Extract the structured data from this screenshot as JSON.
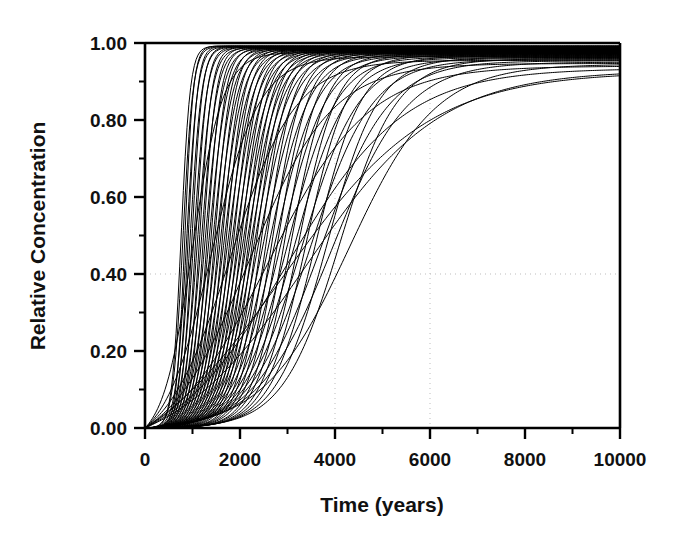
{
  "chart_data": {
    "type": "line",
    "title": "",
    "subtitle": "",
    "xlabel": "Time (years)",
    "ylabel": "Relative Concentration",
    "xlim": [
      0,
      10000
    ],
    "ylim": [
      0.0,
      1.0
    ],
    "x_major_ticks": [
      0,
      2000,
      4000,
      6000,
      8000,
      10000
    ],
    "x_major_tick_labels": [
      "0",
      "2000",
      "4000",
      "6000",
      "8000",
      "10000"
    ],
    "x_minor_ticks": [
      1000,
      3000,
      5000,
      7000,
      9000
    ],
    "y_major_ticks": [
      0.0,
      0.2,
      0.4,
      0.6,
      0.8,
      1.0
    ],
    "y_major_tick_labels": [
      "0.00",
      "0.20",
      "0.40",
      "0.60",
      "0.80",
      "1.00"
    ],
    "y_minor_ticks": [
      0.1,
      0.3,
      0.5,
      0.7,
      0.9
    ],
    "grid": {
      "visible": true,
      "style": "dotted",
      "color": "#bdbdbd",
      "x_gridlines": [
        4000,
        6000
      ],
      "y_gridlines": [
        0.4
      ]
    },
    "legend": {
      "visible": false,
      "position": "none"
    },
    "line_color": "#000000",
    "line_width": 1.0,
    "series_count": 72,
    "series": [
      {
        "name": "realization-1",
        "t50": 760,
        "spread": 210,
        "tail": 0.0
      },
      {
        "name": "realization-2",
        "t50": 800,
        "spread": 230,
        "tail": 0.0
      },
      {
        "name": "realization-3",
        "t50": 840,
        "spread": 195,
        "tail": 0.0
      },
      {
        "name": "realization-4",
        "t50": 880,
        "spread": 250,
        "tail": 0.0
      },
      {
        "name": "realization-5",
        "t50": 910,
        "spread": 215,
        "tail": 0.0
      },
      {
        "name": "realization-6",
        "t50": 950,
        "spread": 270,
        "tail": 0.0
      },
      {
        "name": "realization-7",
        "t50": 990,
        "spread": 240,
        "tail": 0.0
      },
      {
        "name": "realization-8",
        "t50": 1030,
        "spread": 300,
        "tail": 0.0
      },
      {
        "name": "realization-9",
        "t50": 1070,
        "spread": 260,
        "tail": 0.0
      },
      {
        "name": "realization-10",
        "t50": 1110,
        "spread": 330,
        "tail": 0.0
      },
      {
        "name": "realization-11",
        "t50": 1150,
        "spread": 280,
        "tail": 0.0
      },
      {
        "name": "realization-12",
        "t50": 1190,
        "spread": 360,
        "tail": 0.0
      },
      {
        "name": "realization-13",
        "t50": 1230,
        "spread": 300,
        "tail": 0.0
      },
      {
        "name": "realization-14",
        "t50": 1270,
        "spread": 390,
        "tail": 0.0
      },
      {
        "name": "realization-15",
        "t50": 1310,
        "spread": 320,
        "tail": 0.0
      },
      {
        "name": "realization-16",
        "t50": 1350,
        "spread": 420,
        "tail": 0.0
      },
      {
        "name": "realization-17",
        "t50": 1390,
        "spread": 340,
        "tail": 0.0
      },
      {
        "name": "realization-18",
        "t50": 1430,
        "spread": 450,
        "tail": 0.0
      },
      {
        "name": "realization-19",
        "t50": 1470,
        "spread": 360,
        "tail": 0.0
      },
      {
        "name": "realization-20",
        "t50": 1510,
        "spread": 480,
        "tail": 0.0
      },
      {
        "name": "realization-21",
        "t50": 1550,
        "spread": 380,
        "tail": 0.0
      },
      {
        "name": "realization-22",
        "t50": 1590,
        "spread": 510,
        "tail": 0.0
      },
      {
        "name": "realization-23",
        "t50": 1630,
        "spread": 400,
        "tail": 0.0
      },
      {
        "name": "realization-24",
        "t50": 1670,
        "spread": 540,
        "tail": 0.0
      },
      {
        "name": "realization-25",
        "t50": 1710,
        "spread": 420,
        "tail": 0.0
      },
      {
        "name": "realization-26",
        "t50": 1750,
        "spread": 570,
        "tail": 0.0
      },
      {
        "name": "realization-27",
        "t50": 1790,
        "spread": 440,
        "tail": 0.0
      },
      {
        "name": "realization-28",
        "t50": 1830,
        "spread": 600,
        "tail": 0.0
      },
      {
        "name": "realization-29",
        "t50": 1870,
        "spread": 460,
        "tail": 0.0
      },
      {
        "name": "realization-30",
        "t50": 1910,
        "spread": 630,
        "tail": 0.0
      },
      {
        "name": "realization-31",
        "t50": 1950,
        "spread": 480,
        "tail": 0.0
      },
      {
        "name": "realization-32",
        "t50": 1990,
        "spread": 660,
        "tail": 0.0
      },
      {
        "name": "realization-33",
        "t50": 2030,
        "spread": 500,
        "tail": 0.0
      },
      {
        "name": "realization-34",
        "t50": 2070,
        "spread": 690,
        "tail": 0.0
      },
      {
        "name": "realization-35",
        "t50": 2110,
        "spread": 520,
        "tail": 0.0
      },
      {
        "name": "realization-36",
        "t50": 2150,
        "spread": 720,
        "tail": 0.0
      },
      {
        "name": "realization-37",
        "t50": 2190,
        "spread": 540,
        "tail": 0.0
      },
      {
        "name": "realization-38",
        "t50": 2230,
        "spread": 750,
        "tail": 0.0
      },
      {
        "name": "realization-39",
        "t50": 2270,
        "spread": 560,
        "tail": 0.0
      },
      {
        "name": "realization-40",
        "t50": 2310,
        "spread": 780,
        "tail": 0.0
      },
      {
        "name": "realization-41",
        "t50": 2350,
        "spread": 580,
        "tail": 0.0
      },
      {
        "name": "realization-42",
        "t50": 2400,
        "spread": 820,
        "tail": 0.0
      },
      {
        "name": "realization-43",
        "t50": 2450,
        "spread": 600,
        "tail": 0.0
      },
      {
        "name": "realization-44",
        "t50": 2500,
        "spread": 870,
        "tail": 0.0
      },
      {
        "name": "realization-45",
        "t50": 2560,
        "spread": 640,
        "tail": 0.0
      },
      {
        "name": "realization-46",
        "t50": 2620,
        "spread": 920,
        "tail": 0.0
      },
      {
        "name": "realization-47",
        "t50": 2680,
        "spread": 680,
        "tail": 0.0
      },
      {
        "name": "realization-48",
        "t50": 2740,
        "spread": 980,
        "tail": 0.0
      },
      {
        "name": "realization-49",
        "t50": 2800,
        "spread": 720,
        "tail": 0.0
      },
      {
        "name": "realization-50",
        "t50": 2870,
        "spread": 1040,
        "tail": 0.0
      },
      {
        "name": "realization-51",
        "t50": 2940,
        "spread": 760,
        "tail": 0.0
      },
      {
        "name": "realization-52",
        "t50": 3010,
        "spread": 1120,
        "tail": 0.0
      },
      {
        "name": "realization-53",
        "t50": 3080,
        "spread": 820,
        "tail": 0.0
      },
      {
        "name": "realization-54",
        "t50": 3160,
        "spread": 1200,
        "tail": 0.0
      },
      {
        "name": "realization-55",
        "t50": 3240,
        "spread": 880,
        "tail": 0.0
      },
      {
        "name": "realization-56",
        "t50": 3320,
        "spread": 1300,
        "tail": 0.0
      },
      {
        "name": "realization-57",
        "t50": 3400,
        "spread": 950,
        "tail": 0.0
      },
      {
        "name": "realization-58",
        "t50": 3500,
        "spread": 1420,
        "tail": 0.0
      },
      {
        "name": "realization-59",
        "t50": 3600,
        "spread": 1050,
        "tail": 0.0
      },
      {
        "name": "realization-60",
        "t50": 3720,
        "spread": 1560,
        "tail": 0.0
      },
      {
        "name": "realization-61",
        "t50": 3840,
        "spread": 1180,
        "tail": 0.0
      },
      {
        "name": "realization-62",
        "t50": 3960,
        "spread": 1720,
        "tail": 0.0
      },
      {
        "name": "realization-63",
        "t50": 4100,
        "spread": 1320,
        "tail": 0.0
      },
      {
        "name": "realization-64",
        "t50": 2200,
        "spread": 1900,
        "tail": 0.0
      },
      {
        "name": "realization-65",
        "t50": 2600,
        "spread": 2300,
        "tail": 0.0
      },
      {
        "name": "realization-66",
        "t50": 3000,
        "spread": 2700,
        "tail": 0.0
      },
      {
        "name": "realization-67",
        "t50": 3400,
        "spread": 3100,
        "tail": 0.0
      },
      {
        "name": "realization-68",
        "t50": 1800,
        "spread": 1500,
        "tail": 0.0
      },
      {
        "name": "realization-69",
        "t50": 1400,
        "spread": 1100,
        "tail": 0.0
      },
      {
        "name": "realization-70",
        "t50": 1000,
        "spread": 700,
        "tail": 0.0
      },
      {
        "name": "realization-71",
        "t50": 2900,
        "spread": 3400,
        "tail": 0.0
      },
      {
        "name": "realization-72",
        "t50": 4300,
        "spread": 2000,
        "tail": 0.0
      }
    ]
  }
}
